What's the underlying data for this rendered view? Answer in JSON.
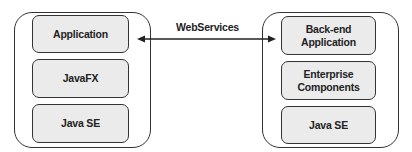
{
  "left_stack": {
    "layers": [
      {
        "label": "Application"
      },
      {
        "label": "JavaFX"
      },
      {
        "label": "Java SE"
      }
    ]
  },
  "right_stack": {
    "layers": [
      {
        "label": "Back-end\nApplication"
      },
      {
        "label": "Enterprise\nComponents"
      },
      {
        "label": "Java SE"
      }
    ]
  },
  "connector": {
    "label": "WebServices",
    "direction": "bidirectional"
  },
  "colors": {
    "box_fill": "#ebebeb",
    "stroke": "#333333"
  }
}
